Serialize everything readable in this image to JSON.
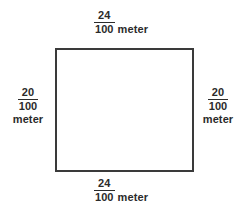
{
  "figure": {
    "type": "rectangle-with-dimension-labels",
    "shape_name": "rectangle",
    "stroke_color": "#3a3a3a",
    "fill_color": "#ffffff",
    "text_color": "#2b2b2b"
  },
  "labels": {
    "top": {
      "numerator": "24",
      "denominator": "100",
      "unit": "meter"
    },
    "bottom": {
      "numerator": "24",
      "denominator": "100",
      "unit": "meter"
    },
    "left": {
      "numerator": "20",
      "denominator": "100",
      "unit": "meter"
    },
    "right": {
      "numerator": "20",
      "denominator": "100",
      "unit": "meter"
    }
  }
}
